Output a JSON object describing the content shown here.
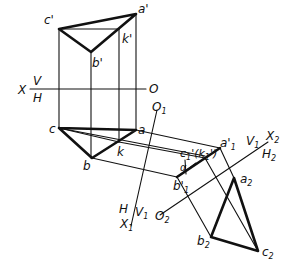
{
  "figure": {
    "type": "auxiliary projection (change of planes) of triangle ABC with point K",
    "labels": {
      "c_prime": "c'",
      "a_prime": "a'",
      "b_prime": "b'",
      "k_prime": "k'",
      "axis_x": "X",
      "axis_v": "V",
      "axis_h": "H",
      "axis_o": "O",
      "c": "c",
      "a": "a",
      "b": "b",
      "k": "k",
      "o1": "O",
      "o1_sub": "1",
      "x1": "X",
      "x1_sub": "1",
      "h_on_x1": "H",
      "v1_on_x1": "V",
      "v1_sub": "1",
      "c1_k1": "c",
      "c1_k1_full": "c'1(k'1)",
      "a1_prime": "a'",
      "a1_sub": "1",
      "b1_prime": "b'",
      "b1_sub": "1",
      "alpha": "α",
      "v1_on_x2": "V",
      "v1_x2_sub": "1",
      "x2": "X",
      "x2_sub": "2",
      "h2": "H",
      "h2_sub": "2",
      "o2": "O",
      "o2_sub": "2",
      "a2": "a",
      "a2_sub": "2",
      "b2": "b",
      "b2_sub": "2",
      "c2": "c",
      "c2_sub": "2"
    },
    "colors": {
      "ink": "#111111",
      "paper": "#ffffff"
    }
  }
}
